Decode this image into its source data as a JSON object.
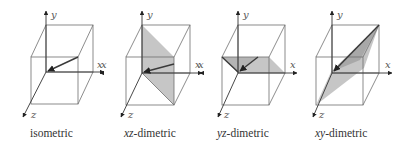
{
  "figure": {
    "panels": [
      {
        "id": "isometric",
        "caption_prefix": "",
        "caption_suffix": "isometric",
        "axis_labels": {
          "x": "x",
          "y": "y",
          "z": "z"
        },
        "shaded_plane": null,
        "vector": "front-top-right corner to origin"
      },
      {
        "id": "xz-dimetric",
        "caption_prefix": "xz",
        "caption_suffix": "-dimetric",
        "axis_labels": {
          "x": "x",
          "x_neg": "x",
          "y": "y",
          "z": "z"
        },
        "shaded_plane": "diagonal plane containing y-axis",
        "vector": "point on front-right edge to origin"
      },
      {
        "id": "yz-dimetric",
        "caption_prefix": "yz",
        "caption_suffix": "-dimetric",
        "axis_labels": {
          "x": "x",
          "x_neg": "x",
          "y": "y",
          "z": "z"
        },
        "shaded_plane": "diagonal plane containing x-axis",
        "vector": "point on front-top edge to origin"
      },
      {
        "id": "xy-dimetric",
        "caption_prefix": "xy",
        "caption_suffix": "-dimetric",
        "axis_labels": {
          "x": "x",
          "y": "y",
          "z": "z"
        },
        "shaded_plane": "diagonal plane containing z-axis",
        "vector": "back-top-right corner to origin"
      }
    ],
    "colors": {
      "edge": "#6e6e6e",
      "axis": "#333333",
      "plane": "#c6c6c6",
      "vector": "#3a3a3a"
    }
  }
}
